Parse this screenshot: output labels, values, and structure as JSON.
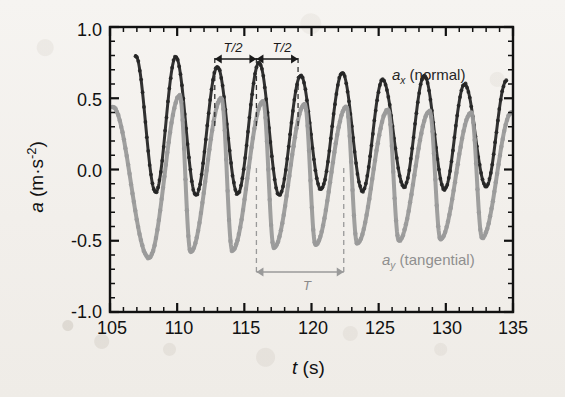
{
  "figure": {
    "background_color": "#f3f0ec",
    "frame_color": "#111111"
  },
  "annotations": {
    "half_period_left": "T/2",
    "half_period_right": "T/2",
    "period": "T",
    "half_period_left_x": 112.8,
    "half_period_mid_x": 115.9,
    "half_period_right_x": 119.0,
    "period_start_x": 116.2,
    "period_end_x": 122.4,
    "dashed_lines_x": [
      112.8,
      115.9,
      119.0,
      122.4
    ],
    "arrow_color_dark": "#1a1a1a",
    "arrow_color_gray": "#9a9a9a"
  },
  "legend": {
    "series_x_label": "a_x (normal)",
    "series_x_symbol": "a",
    "series_x_subscript": "x",
    "series_x_name": "(normal)",
    "series_x_color": "#262626",
    "series_y_label": "a_y (tangential)",
    "series_y_symbol": "a",
    "series_y_subscript": "y",
    "series_y_name": "(tangential)",
    "series_y_color": "#9a9a9a",
    "position": "inside-right"
  },
  "chart_data": {
    "type": "line",
    "title": "",
    "subtitle": "",
    "xlabel": "t (s)",
    "xlabel_symbol": "t",
    "xlabel_unit": "(s)",
    "ylabel": "a (m·s⁻²)",
    "ylabel_symbol": "a",
    "ylabel_unit": "(m·s⁻²)",
    "xlim": [
      105,
      135
    ],
    "ylim": [
      -1.0,
      1.0
    ],
    "xticks": [
      105,
      110,
      115,
      120,
      125,
      130,
      135
    ],
    "xtick_labels": [
      "105",
      "110",
      "115",
      "120",
      "125",
      "130",
      "135"
    ],
    "yticks": [
      -1.0,
      -0.5,
      0.0,
      0.5,
      1.0
    ],
    "ytick_labels": [
      "-1.0",
      "-0.5",
      "0.0",
      "0.5",
      "1.0"
    ],
    "x_minor_tick_step": 1,
    "y_minor_tick_step": 0.1,
    "grid": false,
    "tick_direction": "in",
    "legend_position": "inside-right",
    "period_seconds": 6.2,
    "series": [
      {
        "name": "a_x (normal)",
        "color": "#262626",
        "marker": "dot",
        "linewidth": 3,
        "peak_times": [
          106.9,
          109.9,
          113.0,
          116.1,
          119.2,
          122.3,
          125.3,
          128.4,
          131.4,
          134.5
        ],
        "peak_values": [
          0.8,
          0.79,
          0.72,
          0.75,
          0.66,
          0.68,
          0.63,
          0.66,
          0.6,
          0.62
        ],
        "trough_times": [
          108.4,
          111.4,
          114.5,
          117.6,
          120.7,
          123.8,
          126.9,
          129.9,
          133.0
        ],
        "trough_values": [
          -0.16,
          -0.18,
          -0.17,
          -0.18,
          -0.14,
          -0.15,
          -0.12,
          -0.14,
          -0.12
        ],
        "mean_value": 0.27,
        "half_period_seconds": 3.1,
        "description": "Normal acceleration, rectified-looking oscillation at half the pendulum period"
      },
      {
        "name": "a_y (tangential)",
        "color": "#9a9a9a",
        "marker": "dot",
        "linewidth": 4,
        "peak_times": [
          105.2,
          110.2,
          113.3,
          116.4,
          119.5,
          122.6,
          125.7,
          128.8,
          131.9,
          134.9
        ],
        "peak_values": [
          0.44,
          0.52,
          0.5,
          0.48,
          0.46,
          0.44,
          0.42,
          0.41,
          0.4,
          0.4
        ],
        "trough_times": [
          107.9,
          111.0,
          114.1,
          117.2,
          120.3,
          123.4,
          126.5,
          129.6,
          132.7
        ],
        "trough_values": [
          -0.62,
          -0.58,
          -0.57,
          -0.55,
          -0.53,
          -0.52,
          -0.5,
          -0.49,
          -0.48
        ],
        "mean_value": -0.05,
        "period_seconds": 6.2,
        "description": "Tangential acceleration, sinusoid at the full pendulum period"
      }
    ]
  }
}
